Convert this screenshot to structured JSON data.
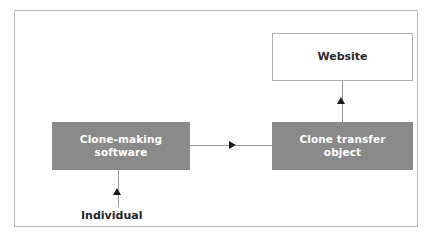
{
  "figure": {
    "nodes": [
      {
        "id": "clone-making-software",
        "label_line1": "Clone-making",
        "label_line2": "software",
        "style": "filled",
        "fill_color": "#8a8a8a",
        "text_color": "#ffffff"
      },
      {
        "id": "clone-transfer-object",
        "label_line1": "Clone transfer",
        "label_line2": "object",
        "style": "filled",
        "fill_color": "#8a8a8a",
        "text_color": "#ffffff"
      },
      {
        "id": "website",
        "label": "Website",
        "style": "outlined",
        "fill_color": "#ffffff",
        "border_color": "#b0b0b0",
        "text_color": "#2b2b2b"
      }
    ],
    "labels": [
      {
        "id": "individual",
        "text": "Individual",
        "text_color": "#232323"
      }
    ],
    "edges": [
      {
        "id": "individual-to-software",
        "from": "individual",
        "to": "clone-making-software",
        "direction": "up",
        "line_color": "#9c9c9c",
        "arrow_color": "#1c1c1c"
      },
      {
        "id": "software-to-transfer",
        "from": "clone-making-software",
        "to": "clone-transfer-object",
        "direction": "right",
        "line_color": "#9c9c9c",
        "arrow_color": "#1c1c1c"
      },
      {
        "id": "transfer-to-website",
        "from": "clone-transfer-object",
        "to": "website",
        "direction": "up",
        "line_color": "#9c9c9c",
        "arrow_color": "#1c1c1c"
      }
    ],
    "frame": {
      "border_color": "#b9b9b9",
      "background_color": "#ffffff"
    }
  }
}
